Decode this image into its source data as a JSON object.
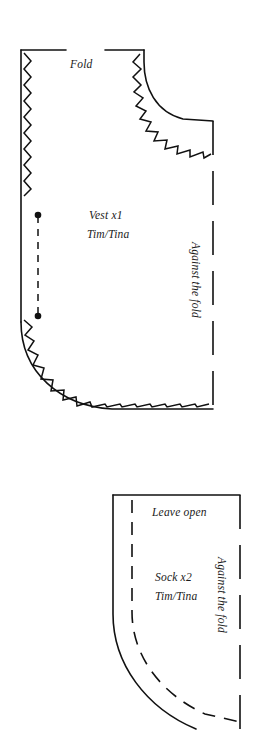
{
  "page": {
    "background_color": "#ffffff",
    "ink_color": "#111111",
    "width": 272,
    "height": 730
  },
  "pieces": [
    {
      "id": "vest",
      "name_label": "Vest x1",
      "maker_label": "Tim/Tina",
      "top_edge_label": "Fold",
      "right_edge_label": "Against the fold",
      "edges": {
        "top": "fold",
        "left": "zigzag-cut-edge",
        "right": "long-dashed-fold",
        "bottom": "zigzag-cut-edge",
        "neckline": "zigzag-cut-edge"
      },
      "grainline": "dashed-line-with-end-dots"
    },
    {
      "id": "sock",
      "name_label": "Sock x2",
      "maker_label": "Tim/Tina",
      "top_edge_label": "Leave open",
      "right_edge_label": "Against the fold",
      "edges": {
        "top": "solid",
        "left": "solid",
        "right": "long-dashed-fold",
        "curve": "solid-with-inner-dashed-stitchline"
      }
    }
  ],
  "labels": {
    "fold": "Fold",
    "vest_name": "Vest x1",
    "vest_maker": "Tim/Tina",
    "vest_against_fold": "Against the fold",
    "leave_open": "Leave open",
    "sock_name": "Sock x2",
    "sock_maker": "Tim/Tina",
    "sock_against_fold": "Against the fold"
  }
}
